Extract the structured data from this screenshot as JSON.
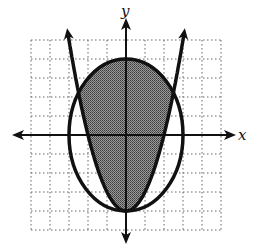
{
  "chart_data": {
    "type": "region-graph",
    "title": "",
    "xlabel": "x",
    "ylabel": "y",
    "xlim": [
      -5,
      5
    ],
    "ylim": [
      -5,
      5
    ],
    "grid": true,
    "grid_style": "dotted",
    "curves": [
      {
        "name": "ellipse",
        "equation": "x^2/9 + y^2/16 = 1",
        "center": [
          0,
          0
        ],
        "semi_x": 3,
        "semi_y": 4
      },
      {
        "name": "parabola",
        "equation": "y = x^2 - 4",
        "vertex": [
          0,
          -4
        ],
        "opens": "up"
      }
    ],
    "shaded_region": "inside ellipse and above parabola",
    "colors": {
      "curve": "#111111",
      "shade": "#7a7a7a",
      "grid": "#555555"
    }
  },
  "labels": {
    "x_axis": "x",
    "y_axis": "y"
  }
}
